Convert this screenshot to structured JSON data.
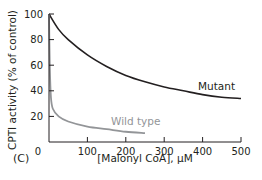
{
  "chart_data": {
    "type": "line",
    "panel_label": "(C)",
    "title": "",
    "xlabel": "[Malonyl CoA], µM",
    "ylabel": "CPTI activity (% of control)",
    "xlim": [
      0,
      500
    ],
    "ylim": [
      0,
      100
    ],
    "x_ticks": [
      0,
      100,
      200,
      300,
      400,
      500
    ],
    "y_ticks": [
      0,
      20,
      40,
      60,
      80,
      100
    ],
    "grid": false,
    "legend": "inline labels",
    "series": [
      {
        "name": "Mutant",
        "color": "#231f20",
        "x": [
          0,
          25,
          50,
          100,
          150,
          200,
          250,
          300,
          350,
          400,
          450,
          500
        ],
        "values": [
          100,
          88,
          80,
          68,
          59,
          52,
          47,
          43,
          40,
          37,
          35,
          34
        ]
      },
      {
        "name": "Wild type",
        "color": "#939598",
        "x": [
          0,
          2,
          5,
          10,
          25,
          50,
          100,
          150,
          200,
          250
        ],
        "values": [
          100,
          60,
          35,
          26,
          20,
          16,
          12,
          10,
          8,
          7
        ]
      }
    ]
  }
}
